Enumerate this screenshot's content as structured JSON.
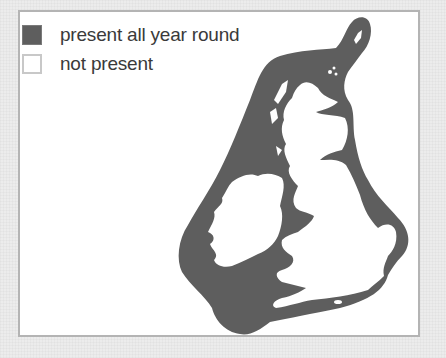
{
  "map": {
    "title": "",
    "region_depicted": "British Isles and surrounding seas",
    "fill_color": "#5e5e5e",
    "land_color": "#ffffff"
  },
  "legend": {
    "items": [
      {
        "label": "present all year round",
        "swatch": "filled",
        "color": "#5e5e5e"
      },
      {
        "label": "not present",
        "swatch": "empty",
        "color": "#ffffff"
      }
    ]
  }
}
